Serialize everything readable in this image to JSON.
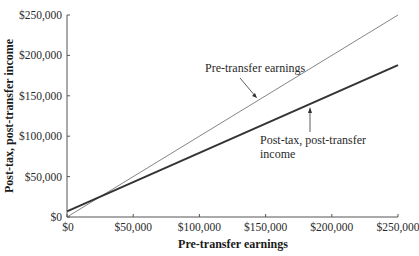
{
  "chart_data": {
    "type": "line",
    "title": "",
    "xlabel": "Pre-transfer earnings",
    "ylabel": "Post-tax, post-transfer income",
    "xlim": [
      0,
      250000
    ],
    "ylim": [
      0,
      250000
    ],
    "grid": false,
    "x_ticks": [
      "$0",
      "$50,000",
      "$100,000",
      "$150,000",
      "$200,000",
      "$250,000"
    ],
    "y_ticks": [
      "$0",
      "$50,000",
      "$100,000",
      "$150,000",
      "$200,000",
      "$250,000"
    ],
    "series": [
      {
        "name": "Pre-transfer earnings",
        "style": "thin",
        "x": [
          0,
          250000
        ],
        "y": [
          0,
          250000
        ]
      },
      {
        "name": "Post-tax, post-transfer income",
        "style": "thick",
        "x": [
          0,
          250000
        ],
        "y": [
          7000,
          188000
        ]
      }
    ],
    "annotations": [
      {
        "text": "Pre-transfer earnings",
        "points_to": "Pre-transfer earnings",
        "at_x": 135000
      },
      {
        "text_line1": "Post-tax, post-transfer",
        "text_line2": "income",
        "points_to": "Post-tax, post-transfer income",
        "at_x": 180000
      }
    ]
  }
}
